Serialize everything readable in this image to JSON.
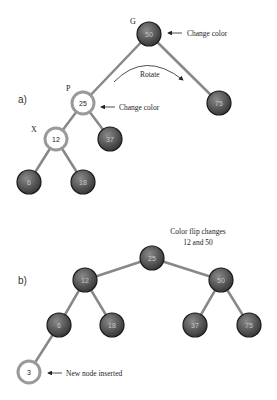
{
  "colors": {
    "black_node_fill": "#555555",
    "black_node_stroke": "#1a1a1a",
    "red_node_ring": "#9a9a9a",
    "edge": "#888888",
    "text": "#222222",
    "black_node_text": "#c8c8c8"
  },
  "part_a": {
    "label": "a)",
    "nodes": [
      {
        "id": "a50",
        "value": "50",
        "tag": "G",
        "color": "black",
        "x": 149,
        "y": 34
      },
      {
        "id": "a25",
        "value": "25",
        "tag": "P",
        "color": "red",
        "x": 83,
        "y": 103
      },
      {
        "id": "a75",
        "value": "75",
        "tag": "",
        "color": "black",
        "x": 219,
        "y": 103
      },
      {
        "id": "a12",
        "value": "12",
        "tag": "X",
        "color": "red",
        "x": 56,
        "y": 139
      },
      {
        "id": "a37",
        "value": "37",
        "tag": "",
        "color": "black",
        "x": 110,
        "y": 139
      },
      {
        "id": "a6",
        "value": "6",
        "tag": "",
        "color": "black",
        "x": 29,
        "y": 182
      },
      {
        "id": "a18",
        "value": "18",
        "tag": "",
        "color": "black",
        "x": 83,
        "y": 182
      }
    ],
    "annotations": {
      "change_color_g": "Change color",
      "change_color_p": "Change color",
      "rotate": "Rotate"
    }
  },
  "part_b": {
    "label": "b)",
    "nodes": [
      {
        "id": "b25",
        "value": "25",
        "color": "black",
        "x": 152,
        "y": 258
      },
      {
        "id": "b12",
        "value": "12",
        "color": "black",
        "x": 85,
        "y": 280
      },
      {
        "id": "b50",
        "value": "50",
        "color": "black",
        "x": 221,
        "y": 280
      },
      {
        "id": "b6",
        "value": "6",
        "color": "black",
        "x": 59,
        "y": 325
      },
      {
        "id": "b18",
        "value": "18",
        "color": "black",
        "x": 112,
        "y": 325
      },
      {
        "id": "b37",
        "value": "37",
        "color": "black",
        "x": 195,
        "y": 325
      },
      {
        "id": "b75",
        "value": "75",
        "color": "black",
        "x": 249,
        "y": 325
      },
      {
        "id": "b3",
        "value": "3",
        "color": "red",
        "x": 29,
        "y": 372
      }
    ],
    "annotations": {
      "color_flip_line1": "Color flip changes",
      "color_flip_line2": "12 and 50",
      "new_node": "New node inserted"
    }
  }
}
